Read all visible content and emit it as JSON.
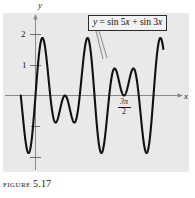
{
  "figure": {
    "caption_word": "FIGURE",
    "caption_number": "5.17"
  },
  "callout": {
    "equation_text": "y = sin 5x + sin 3x",
    "lhs": "y",
    "eq": " = ",
    "term1": "sin 5x",
    "plus": " + ",
    "term2": "sin 3x"
  },
  "axes": {
    "x_name": "x",
    "y_name": "y",
    "y_ticks": [
      "2",
      "1"
    ],
    "x_tick_label": {
      "numerator": "3π",
      "denominator": "2"
    }
  },
  "colors": {
    "panel_background": "#e9e9e9",
    "page_background": "#ffffff",
    "axis": "#8a8a8a",
    "curve": "#111111",
    "text": "#1a1a1a",
    "box_border": "#2a2a2a",
    "box_fill": "#f2f2f2",
    "leader_line": "#9a9a9a"
  },
  "chart_data": {
    "type": "line",
    "title": "",
    "xlabel": "x",
    "ylabel": "y",
    "function": "y = sin 5x + sin 3x",
    "series": [
      {
        "name": "y = sin 5x + sin 3x",
        "expression": "sin(5x) + sin(3x)",
        "x_start": -0.7853981634,
        "x_end": 6.8067840828,
        "samples": 900
      }
    ],
    "xlim": [
      -0.7853981634,
      6.8067840828
    ],
    "ylim": [
      -2.2,
      2.2
    ],
    "x_ticks": [
      4.7123889804
    ],
    "x_tick_labels": [
      "3π/2"
    ],
    "y_ticks": [
      1,
      2
    ],
    "y_tick_labels": [
      "1",
      "2"
    ],
    "grid": false,
    "legend": "none",
    "annotations": [
      {
        "text": "y = sin 5x + sin 3x",
        "type": "boxed-callout-with-leader",
        "box_px": [
          88,
          15,
          94,
          15
        ],
        "leader_target_px": [
          103,
          58
        ]
      }
    ]
  }
}
